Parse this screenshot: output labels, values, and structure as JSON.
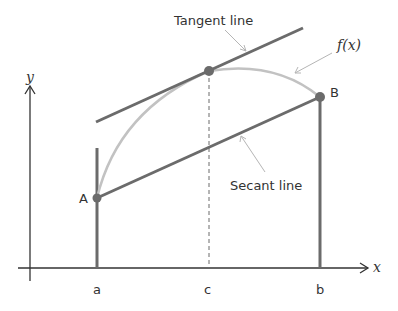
{
  "diagram": {
    "colors": {
      "line_dark": "#6b6b6b",
      "curve": "#c2c2c2",
      "axis": "#333333",
      "pointer": "#b5b5b5",
      "point": "#6b6b6b"
    },
    "axes": {
      "x_label": "x",
      "y_label": "y"
    },
    "tick_labels": {
      "a": "a",
      "c": "c",
      "b": "b"
    },
    "points": {
      "A": "A",
      "B": "B"
    },
    "annotations": {
      "tangent": "Tangent line",
      "secant": "Secant line",
      "function": "f(x)"
    }
  }
}
